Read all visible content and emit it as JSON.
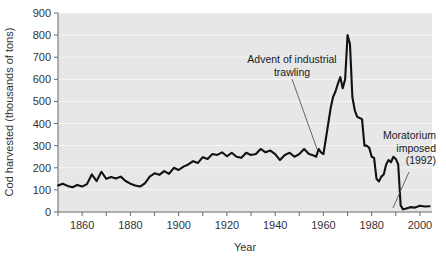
{
  "chart_data": {
    "type": "line",
    "title": "",
    "xlabel": "Year",
    "ylabel": "Cod harvested (thousands of tons)",
    "xlim": [
      1850,
      2005
    ],
    "ylim": [
      0,
      900
    ],
    "grid": true,
    "legend_position": "none",
    "y_ticks": [
      0,
      100,
      200,
      300,
      400,
      500,
      600,
      700,
      800,
      900
    ],
    "y_tick_labels": [
      "0",
      "100",
      "200",
      "300",
      "400",
      "500",
      "600",
      "700",
      "800",
      "900"
    ],
    "x_ticks_major": [
      1860,
      1880,
      1900,
      1920,
      1940,
      1960,
      1980,
      2000
    ],
    "x_tick_labels": [
      "1860",
      "1880",
      "1900",
      "1920",
      "1940",
      "1960",
      "1980",
      "2000"
    ],
    "x_ticks_minor": [
      1850,
      1870,
      1890,
      1910,
      1930,
      1950,
      1970,
      1990
    ],
    "series": [
      {
        "name": "Cod harvest",
        "color": "#111111",
        "x": [
          1850,
          1852,
          1854,
          1856,
          1858,
          1860,
          1862,
          1864,
          1866,
          1868,
          1870,
          1872,
          1874,
          1876,
          1878,
          1880,
          1882,
          1884,
          1886,
          1888,
          1890,
          1892,
          1894,
          1896,
          1898,
          1900,
          1902,
          1904,
          1906,
          1908,
          1910,
          1912,
          1914,
          1916,
          1918,
          1920,
          1922,
          1924,
          1926,
          1928,
          1930,
          1932,
          1934,
          1936,
          1938,
          1940,
          1942,
          1944,
          1946,
          1948,
          1950,
          1952,
          1954,
          1956,
          1957,
          1958,
          1959,
          1960,
          1961,
          1962,
          1963,
          1964,
          1965,
          1966,
          1967,
          1968,
          1969,
          1970,
          1971,
          1972,
          1973,
          1974,
          1975,
          1976,
          1977,
          1978,
          1979,
          1980,
          1981,
          1982,
          1983,
          1984,
          1985,
          1986,
          1987,
          1988,
          1989,
          1990,
          1991,
          1992,
          1993,
          1994,
          1996,
          1998,
          2000,
          2002,
          2004
        ],
        "y": [
          120,
          128,
          118,
          112,
          122,
          115,
          126,
          170,
          140,
          182,
          150,
          158,
          152,
          160,
          140,
          128,
          120,
          115,
          130,
          160,
          175,
          168,
          185,
          172,
          200,
          190,
          205,
          215,
          230,
          222,
          248,
          240,
          262,
          258,
          270,
          252,
          268,
          250,
          245,
          268,
          258,
          262,
          285,
          270,
          278,
          262,
          235,
          258,
          268,
          250,
          262,
          285,
          262,
          255,
          250,
          285,
          270,
          262,
          330,
          400,
          470,
          520,
          545,
          580,
          610,
          560,
          600,
          800,
          760,
          520,
          460,
          430,
          425,
          420,
          300,
          300,
          290,
          250,
          245,
          150,
          138,
          160,
          170,
          215,
          235,
          225,
          250,
          240,
          215,
          30,
          12,
          15,
          22,
          20,
          28,
          25,
          26
        ]
      }
    ],
    "annotations": [
      {
        "id": "trawling",
        "lines": [
          "Advent of industrial",
          "trawling"
        ],
        "align": "center",
        "text_x": 292,
        "text_y": 63,
        "leader_from": [
          292,
          79
        ],
        "leader_to": [
          317,
          149
        ]
      },
      {
        "id": "moratorium",
        "lines": [
          "Moratorium",
          "imposed",
          "(1992)"
        ],
        "align": "right",
        "text_x": 436,
        "text_y": 139,
        "leader_from": [
          409,
          172
        ],
        "leader_to": [
          393,
          208
        ]
      }
    ],
    "style": {
      "plot_background": "#e7e7e7",
      "gridline_color": "#f7f7f7",
      "axis_color": "#6b6b6b",
      "line_color": "#111111",
      "text_color": "#333333"
    }
  }
}
